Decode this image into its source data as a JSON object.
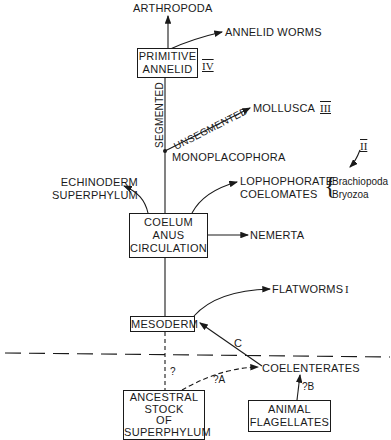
{
  "diagram": {
    "nodes": {
      "arthropoda": "ARTHROPODA",
      "annelid_worms": "ANNELID WORMS",
      "primitive_annelid": [
        "PRIMITIVE",
        "ANNELID"
      ],
      "mollusca": "MOLLUSCA",
      "monoplacophora": "MONOPLACOPHORA",
      "echinoderm": [
        "ECHINODERM",
        "SUPERPHYLUM"
      ],
      "lophophorate": [
        "LOPHOPHORATE",
        "COELOMATES"
      ],
      "lophophorate_members": [
        "Brachiopoda",
        "Bryozoa"
      ],
      "coelum": [
        "COELUM",
        "ANUS",
        "CIRCULATION"
      ],
      "nemerta": "NEMERTA",
      "flatworms": "FLATWORMS",
      "mesoderm": "MESODERM",
      "coelenterates": "COELENTERATES",
      "ancestral": [
        "ANCESTRAL",
        "STOCK",
        "OF",
        "SUPERPHYLUM"
      ],
      "animal_flagellates": [
        "ANIMAL",
        "FLAGELLATES"
      ]
    },
    "edge_labels": {
      "segmented": "SEGMENTED",
      "unsegmented": "UNSEGMENTED",
      "c": "C",
      "q_ancestral": "?",
      "q_a": "?A",
      "q_b": "?B"
    },
    "group_numerals": {
      "I": "I",
      "II": "II",
      "III": "III",
      "IV": "IV"
    }
  }
}
